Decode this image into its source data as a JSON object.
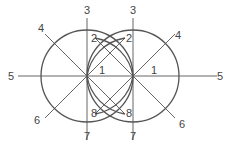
{
  "diagram": {
    "circles": [
      {
        "id": "left",
        "cx": 87,
        "cy": 76,
        "r": 46
      },
      {
        "id": "right",
        "cx": 133,
        "cy": 76,
        "r": 46
      }
    ],
    "lines": [
      {
        "id": "horizontal-5",
        "x1": 18,
        "y1": 76,
        "x2": 217,
        "y2": 76
      },
      {
        "id": "left-vertical-3-7",
        "x1": 87,
        "y1": 18,
        "x2": 87,
        "y2": 140
      },
      {
        "id": "right-vertical-3-7",
        "x1": 133,
        "y1": 18,
        "x2": 133,
        "y2": 140
      },
      {
        "id": "left-diag-4",
        "x1": 45,
        "y1": 34,
        "x2": 87,
        "y2": 76
      },
      {
        "id": "left-diag-6",
        "x1": 45,
        "y1": 118,
        "x2": 87,
        "y2": 76
      },
      {
        "id": "right-diag-4",
        "x1": 175,
        "y1": 34,
        "x2": 133,
        "y2": 76
      },
      {
        "id": "right-diag-6",
        "x1": 175,
        "y1": 118,
        "x2": 133,
        "y2": 76
      },
      {
        "id": "cross-2-8-a",
        "x1": 87,
        "y1": 76,
        "x2": 125,
        "y2": 114
      },
      {
        "id": "cross-2-8-b",
        "x1": 133,
        "y1": 76,
        "x2": 95,
        "y2": 114
      },
      {
        "id": "cross-up-a",
        "x1": 87,
        "y1": 76,
        "x2": 125,
        "y2": 38
      },
      {
        "id": "cross-up-b",
        "x1": 133,
        "y1": 76,
        "x2": 95,
        "y2": 38
      }
    ],
    "arcs": [
      {
        "id": "arc-left-inner",
        "d": "M87,76 A46,46 0 0 1 125,38"
      },
      {
        "id": "arc-right-inner",
        "d": "M133,76 A46,46 0 0 0 95,38"
      },
      {
        "id": "arc-left-inner-bottom",
        "d": "M87,76 A46,46 0 0 0 125,114"
      },
      {
        "id": "arc-right-inner-bottom",
        "d": "M133,76 A46,46 0 0 1 95,114"
      }
    ],
    "labels": [
      {
        "text": "3",
        "x": 84,
        "y": 14
      },
      {
        "text": "3",
        "x": 130,
        "y": 14
      },
      {
        "text": "4",
        "x": 38,
        "y": 32
      },
      {
        "text": "4",
        "x": 175,
        "y": 39
      },
      {
        "text": "2",
        "x": 91,
        "y": 42
      },
      {
        "text": "2",
        "x": 126,
        "y": 42
      },
      {
        "text": "5",
        "x": 8,
        "y": 80
      },
      {
        "text": "5",
        "x": 217,
        "y": 80
      },
      {
        "text": "1",
        "x": 99,
        "y": 74
      },
      {
        "text": "1",
        "x": 151,
        "y": 74
      },
      {
        "text": "6",
        "x": 34,
        "y": 124
      },
      {
        "text": "6",
        "x": 179,
        "y": 128
      },
      {
        "text": "8",
        "x": 91,
        "y": 117
      },
      {
        "text": "8",
        "x": 126,
        "y": 117
      },
      {
        "text": "7",
        "x": 84,
        "y": 140
      },
      {
        "text": "7",
        "x": 130,
        "y": 140
      }
    ]
  }
}
